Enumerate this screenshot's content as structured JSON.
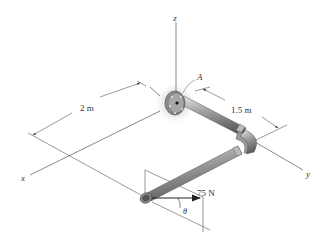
{
  "diagram": {
    "type": "3d-pipe-assembly",
    "axes": {
      "x_label": "x",
      "y_label": "y",
      "z_label": "z"
    },
    "support": {
      "label": "A",
      "type": "flange-fixed-support"
    },
    "dimensions": {
      "along_x": "2 m",
      "along_y": "1.5 m"
    },
    "load": {
      "magnitude_label": "75 N",
      "angle_label": "θ"
    },
    "colors": {
      "pipe": "#9a9a9a",
      "pipe_highlight": "#d8d8d8",
      "pipe_shadow": "#5a5a5a",
      "line": "#444444",
      "arrow": "#222222"
    }
  }
}
